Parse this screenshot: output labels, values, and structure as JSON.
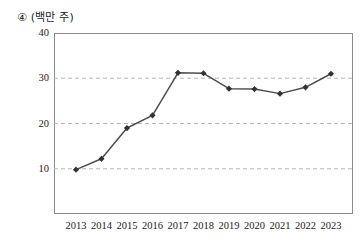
{
  "chart_data": {
    "type": "line",
    "title": "④ (백만 주)",
    "xlabel": "",
    "ylabel": "",
    "unit_note": "(백만 주)",
    "item_marker": "④",
    "categories": [
      "2013",
      "2014",
      "2015",
      "2016",
      "2017",
      "2018",
      "2019",
      "2020",
      "2021",
      "2022",
      "2023"
    ],
    "values": [
      9.8,
      12.2,
      19.0,
      21.8,
      31.2,
      31.1,
      27.7,
      27.6,
      26.6,
      28.0,
      31.0
    ],
    "series": [
      {
        "name": "shares",
        "values": [
          9.8,
          12.2,
          19.0,
          21.8,
          31.2,
          31.1,
          27.7,
          27.6,
          26.6,
          28.0,
          31.0
        ]
      }
    ],
    "ylim": [
      0,
      40
    ],
    "yticks": [
      10,
      20,
      30,
      40
    ],
    "ytick_labels": [
      "10",
      "20",
      "30",
      "40"
    ],
    "xlim": [
      2013,
      2023
    ],
    "grid": "horizontal-dashed",
    "legend": "none",
    "line_color": "#4d4d4d",
    "marker": "diamond",
    "marker_color": "#333333",
    "grid_color": "#b9b9b9",
    "frame_color": "#8c8c8c"
  }
}
